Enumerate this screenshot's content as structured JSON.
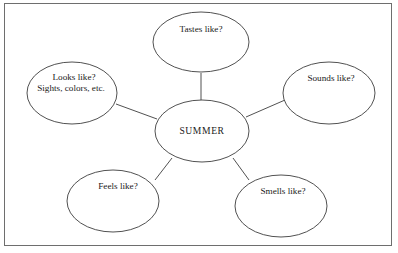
{
  "worksheet": {
    "title_text": "SUMMER",
    "diagram_type": "sense-web-graphic-organizer",
    "frame_color": "#6e6e6e",
    "line_color": "#3d3d3d",
    "background_color": "#ffffff"
  },
  "center_node": {
    "label": "SUMMER",
    "cx": 202,
    "cy": 131,
    "rx": 47,
    "ry": 31
  },
  "nodes": [
    {
      "id": "tastes",
      "lines": [
        "Tastes like?"
      ],
      "cx": 201,
      "cy": 42,
      "rx": 48,
      "ry": 30
    },
    {
      "id": "sounds",
      "lines": [
        "Sounds like?"
      ],
      "cx": 329,
      "cy": 93,
      "rx": 46,
      "ry": 31
    },
    {
      "id": "smells",
      "lines": [
        "Smells like?"
      ],
      "cx": 281,
      "cy": 206,
      "rx": 46,
      "ry": 31
    },
    {
      "id": "feels",
      "lines": [
        "Feels like?"
      ],
      "cx": 113,
      "cy": 201,
      "rx": 46,
      "ry": 31
    },
    {
      "id": "looks",
      "lines": [
        "Looks like?",
        "Sights, colors, etc."
      ],
      "cx": 72,
      "cy": 93,
      "rx": 45,
      "ry": 31
    }
  ],
  "connectors": [
    {
      "id": "center-to-tastes",
      "x1": 201,
      "y1": 100,
      "x2": 201,
      "y2": 73
    },
    {
      "id": "center-to-sounds",
      "x1": 246,
      "y1": 117,
      "x2": 285,
      "y2": 100
    },
    {
      "id": "center-to-smells",
      "x1": 233,
      "y1": 158,
      "x2": 249,
      "y2": 180
    },
    {
      "id": "center-to-feels",
      "x1": 172,
      "y1": 158,
      "x2": 155,
      "y2": 180
    },
    {
      "id": "center-to-looks",
      "x1": 157,
      "y1": 119,
      "x2": 116,
      "y2": 104
    }
  ]
}
